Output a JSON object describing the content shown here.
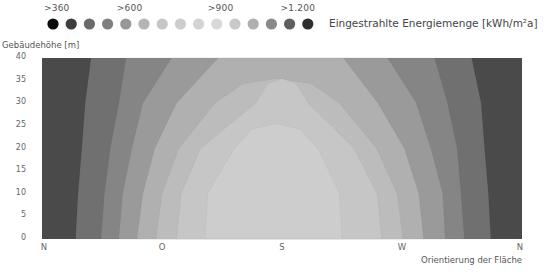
{
  "legend": {
    "title": "Eingestrahlte Energiemenge [kWh/m²a]",
    "tick_labels": [
      {
        "label": ">360",
        "index": 0
      },
      {
        "label": ">600",
        "index": 4
      },
      {
        "label": ">900",
        "index": 9
      },
      {
        "label": ">1.200",
        "index": 13
      }
    ],
    "dot_colors": [
      "#0d0d0d",
      "#3d3d3d",
      "#6a6a6a",
      "#7f7f7f",
      "#979797",
      "#b4b4b4",
      "#c6c6c6",
      "#cdcdcd",
      "#d3d3d3",
      "#d8d8d8",
      "#c8c8c8",
      "#b0b0b0",
      "#8a8a8a",
      "#5f5f5f",
      "#2e2e2e"
    ]
  },
  "axes": {
    "y_title": "Gebäudehöhe [m]",
    "y_ticks": [
      "40",
      "35",
      "30",
      "25",
      "20",
      "15",
      "10",
      "5",
      "0"
    ],
    "x_ticks": [
      "N",
      "O",
      "S",
      "W",
      "N"
    ],
    "x_title": "Orientierung der Fläche"
  },
  "chart_data": {
    "type": "heatmap",
    "subtype": "filled-contour",
    "title": "",
    "xlabel": "Orientierung der Fläche",
    "ylabel": "Gebäudehöhe [m]",
    "x_categories": [
      "N",
      "O",
      "S",
      "W",
      "N"
    ],
    "ylim": [
      0,
      40
    ],
    "y_ticks": [
      0,
      5,
      10,
      15,
      20,
      25,
      30,
      35,
      40
    ],
    "colorbar_label": "Eingestrahlte Energiemenge [kWh/m²a]",
    "colorbar_ticks": [
      ">360",
      ">600",
      ">900",
      ">1.200"
    ],
    "levels": 15,
    "contours_xfrac_by_height": {
      "heights": [
        0,
        10,
        20,
        30,
        40
      ],
      "bands": [
        {
          "level": 1,
          "left": [
            0.07,
            0.075,
            0.083,
            0.09,
            0.102
          ],
          "right": [
            0.935,
            0.93,
            0.922,
            0.915,
            0.895
          ]
        },
        {
          "level": 2,
          "left": [
            0.123,
            0.13,
            0.142,
            0.16,
            0.175
          ],
          "right": [
            0.88,
            0.873,
            0.865,
            0.845,
            0.818
          ]
        },
        {
          "level": 3,
          "left": [
            0.16,
            0.168,
            0.187,
            0.21,
            0.27
          ],
          "right": [
            0.84,
            0.835,
            0.81,
            0.78,
            0.72
          ]
        },
        {
          "level": 4,
          "left": [
            0.198,
            0.21,
            0.235,
            0.28,
            0.367
          ],
          "right": [
            0.795,
            0.785,
            0.755,
            0.7,
            0.628
          ]
        },
        {
          "level": 5,
          "left": [
            0.237,
            0.25,
            0.285,
            0.36,
            null
          ],
          "right": [
            0.752,
            0.74,
            0.697,
            0.62,
            null
          ]
        },
        {
          "level": 6,
          "left": [
            0.28,
            0.29,
            0.33,
            0.445,
            null
          ],
          "right": [
            0.708,
            0.698,
            0.65,
            0.555,
            null
          ]
        },
        {
          "level": 7,
          "left": [
            0.34,
            0.345,
            0.4,
            null,
            null
          ],
          "right": [
            0.625,
            0.62,
            0.575,
            null,
            null
          ]
        }
      ]
    }
  },
  "colors": {
    "bands": [
      "#4a4a4a",
      "#707070",
      "#858585",
      "#9a9a9a",
      "#b0b0b0",
      "#bcbcbc",
      "#c6c6c6",
      "#cdcdcd"
    ]
  }
}
